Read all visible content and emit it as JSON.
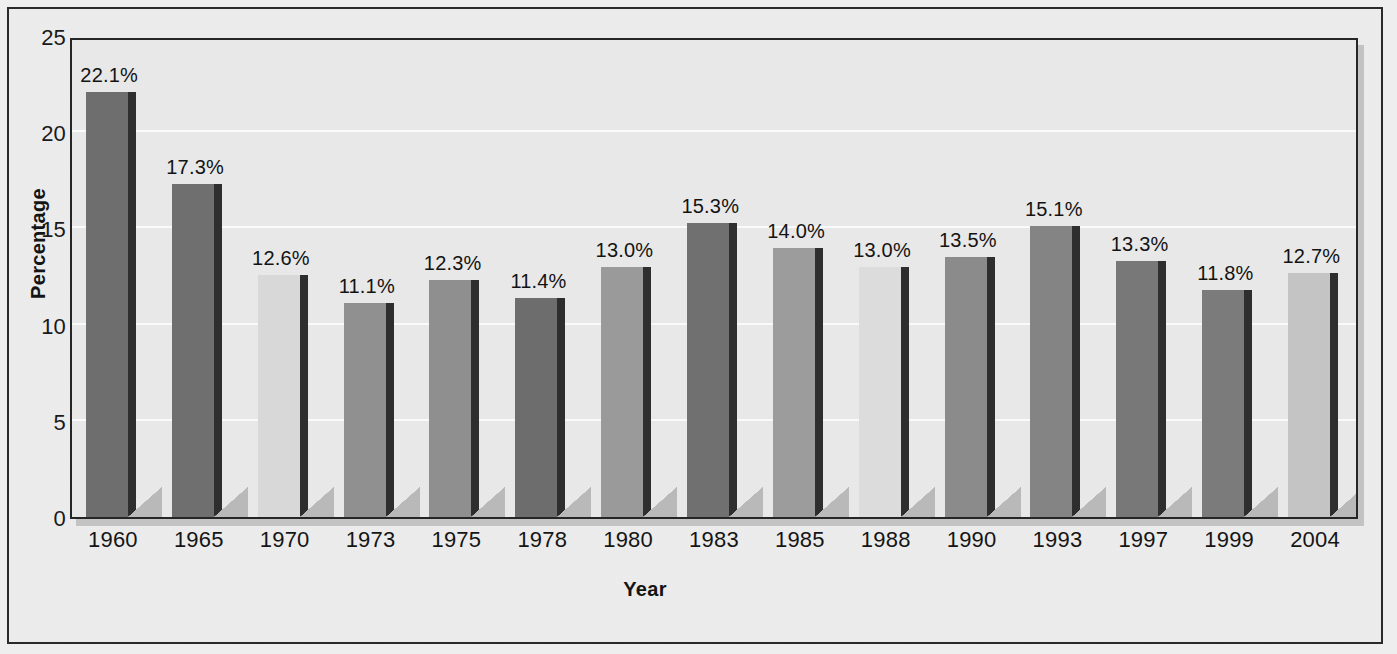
{
  "chart_data": {
    "type": "bar",
    "title": "",
    "xlabel": "Year",
    "ylabel": "Percentage",
    "categories": [
      "1960",
      "1965",
      "1970",
      "1973",
      "1975",
      "1978",
      "1980",
      "1983",
      "1985",
      "1988",
      "1990",
      "1993",
      "1997",
      "1999",
      "2004"
    ],
    "values": [
      22.1,
      17.3,
      12.6,
      11.1,
      12.3,
      11.4,
      13.0,
      15.3,
      14.0,
      13.0,
      13.5,
      15.1,
      13.3,
      11.8,
      12.7
    ],
    "data_labels": [
      "22.1%",
      "17.3%",
      "12.6%",
      "11.1%",
      "12.3%",
      "11.4%",
      "13.0%",
      "15.3%",
      "14.0%",
      "13.0%",
      "13.5%",
      "15.1%",
      "13.3%",
      "11.8%",
      "12.7%"
    ],
    "bar_colors": [
      "#6e6e6e",
      "#6f6f6f",
      "#d8d8d8",
      "#909090",
      "#8f8f8f",
      "#6d6d6d",
      "#9a9a9a",
      "#707070",
      "#9c9c9c",
      "#dcdcdc",
      "#8b8b8b",
      "#848484",
      "#787878",
      "#7b7b7b",
      "#c4c4c4"
    ],
    "ylim": [
      0,
      25
    ],
    "yticks": [
      0,
      5,
      10,
      15,
      20,
      25
    ],
    "ytick_labels": [
      "0",
      "5",
      "10",
      "15",
      "20",
      "25"
    ],
    "grid": true,
    "legend": "none",
    "plot_background": "#e8e8e8",
    "page_background": "#ececec",
    "axis_color": "#262626"
  }
}
